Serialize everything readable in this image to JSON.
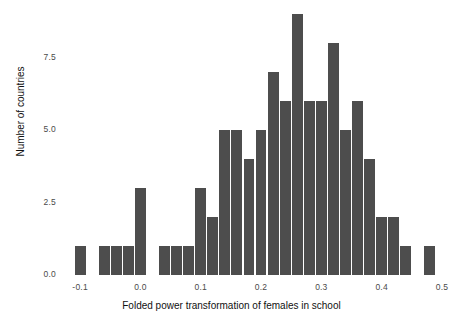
{
  "chart_data": {
    "type": "bar",
    "title": "",
    "subtitle": "",
    "xlabel": "Folded power transformation of females in school",
    "ylabel": "Number of countries",
    "xlim": [
      -0.13,
      0.51
    ],
    "ylim": [
      0,
      9
    ],
    "grid": false,
    "legend": null,
    "bin_width": 0.02,
    "x_ticks": [
      -0.1,
      0.0,
      0.1,
      0.2,
      0.3,
      0.4,
      0.5
    ],
    "x_tick_labels": [
      "-0.1",
      "0.0",
      "0.1",
      "0.2",
      "0.3",
      "0.4",
      "0.5"
    ],
    "y_ticks": [
      0.0,
      2.5,
      5.0,
      7.5
    ],
    "y_tick_labels": [
      "0.0",
      "2.5",
      "5.0",
      "7.5"
    ],
    "bar_color": "#4d4d4d",
    "background_color": "#ffffff",
    "bin_starts": [
      -0.11,
      -0.09,
      -0.07,
      -0.05,
      -0.03,
      -0.01,
      0.01,
      0.03,
      0.05,
      0.07,
      0.09,
      0.11,
      0.13,
      0.15,
      0.17,
      0.19,
      0.21,
      0.23,
      0.25,
      0.27,
      0.29,
      0.31,
      0.33,
      0.35,
      0.37,
      0.39,
      0.41,
      0.43,
      0.45,
      0.47
    ],
    "bin_centers": [
      -0.1,
      -0.08,
      -0.06,
      -0.04,
      -0.02,
      0.0,
      0.02,
      0.04,
      0.06,
      0.08,
      0.1,
      0.12,
      0.14,
      0.16,
      0.18,
      0.2,
      0.22,
      0.24,
      0.26,
      0.28,
      0.3,
      0.32,
      0.34,
      0.36,
      0.38,
      0.4,
      0.42,
      0.44,
      0.46,
      0.48
    ],
    "categories": [
      "-0.10",
      "-0.08",
      "-0.06",
      "-0.04",
      "-0.02",
      "0.00",
      "0.02",
      "0.04",
      "0.06",
      "0.08",
      "0.10",
      "0.12",
      "0.14",
      "0.16",
      "0.18",
      "0.20",
      "0.22",
      "0.24",
      "0.26",
      "0.28",
      "0.30",
      "0.32",
      "0.34",
      "0.36",
      "0.38",
      "0.40",
      "0.42",
      "0.44",
      "0.46",
      "0.48"
    ],
    "values": [
      1,
      0,
      1,
      1,
      1,
      3,
      0,
      1,
      1,
      1,
      3,
      2,
      5,
      5,
      4,
      5,
      7,
      6,
      9,
      6,
      6,
      8,
      5,
      6,
      4,
      2,
      2,
      1,
      0,
      1
    ]
  }
}
